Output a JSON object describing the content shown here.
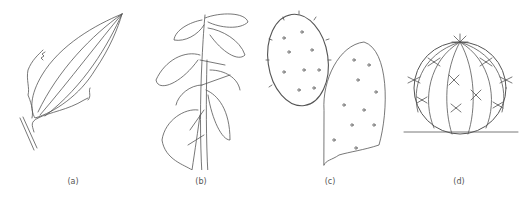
{
  "figure": {
    "panels": [
      {
        "id": "a",
        "label": "(a)",
        "subject": "leaf with wavy margin and parallel veins"
      },
      {
        "id": "b",
        "label": "(b)",
        "subject": "leafy stem with clustered leaves"
      },
      {
        "id": "c",
        "label": "(c)",
        "subject": "prickly pear cactus pads with spines"
      },
      {
        "id": "d",
        "label": "(d)",
        "subject": "round barrel cactus with ribs and spine clusters"
      }
    ],
    "colors": {
      "background": "#ffffff",
      "line": "#555555"
    }
  }
}
